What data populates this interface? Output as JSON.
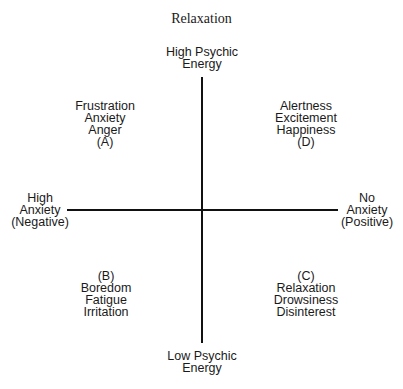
{
  "title": "Relaxation",
  "axes": {
    "top": [
      "High Psychic",
      "Energy"
    ],
    "bottom": [
      "Low Psychic",
      "Energy"
    ],
    "left": [
      "High",
      "Anxiety",
      "(Negative)"
    ],
    "right": [
      "No",
      "Anxiety",
      "(Positive)"
    ]
  },
  "quadrants": {
    "A": [
      "Frustration",
      "Anxiety",
      "Anger",
      "(A)"
    ],
    "D": [
      "Alertness",
      "Excitement",
      "Happiness",
      "(D)"
    ],
    "B": [
      "(B)",
      "Boredom",
      "Fatigue",
      "Irritation"
    ],
    "C": [
      "(C)",
      "Relaxation",
      "Drowsiness",
      "Disinterest"
    ]
  },
  "colors": {
    "line": "#111111",
    "text": "#1a1a1a",
    "background": "#ffffff"
  }
}
